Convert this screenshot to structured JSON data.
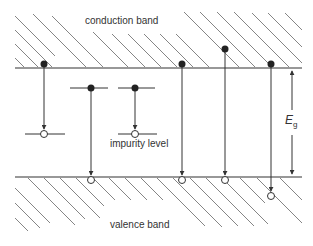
{
  "diagram": {
    "labels": {
      "conduction_band": "conduction band",
      "valence_band": "valence band",
      "impurity_level": "impurity level",
      "gap_symbol": "E",
      "gap_subscript": "g"
    },
    "colors": {
      "line": "#333333",
      "hatch": "#555555",
      "electron_fill": "#222222",
      "hole_fill": "#ffffff"
    },
    "bands": {
      "conduction_edge_y": 68,
      "valence_edge_y": 177,
      "x_start": 15,
      "x_end": 302
    },
    "transitions": [
      {
        "id": "t1",
        "description": "conduction band to impurity level",
        "electron": [
          44,
          64
        ],
        "hole": [
          44,
          134
        ]
      },
      {
        "id": "t2",
        "description": "impurity level to valence band",
        "electron": [
          91,
          88
        ],
        "hole": [
          91,
          180
        ]
      },
      {
        "id": "t3",
        "description": "impurity level to impurity level",
        "electron": [
          135,
          88
        ],
        "hole": [
          135,
          134
        ]
      },
      {
        "id": "t4",
        "description": "band edge to band edge",
        "electron": [
          182,
          64
        ],
        "hole": [
          182,
          180
        ]
      },
      {
        "id": "t5",
        "description": "above conduction edge to valence edge",
        "electron": [
          225,
          49
        ],
        "hole": [
          225,
          180
        ]
      },
      {
        "id": "t6",
        "description": "conduction edge to below valence edge",
        "electron": [
          271,
          64
        ],
        "hole": [
          271,
          196
        ]
      }
    ]
  }
}
